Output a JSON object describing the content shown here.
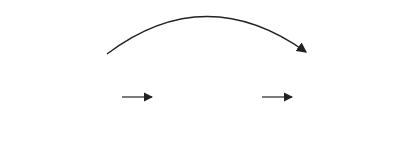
{
  "composition_label": "H ∘ D",
  "arrows": [
    {
      "label": "D"
    },
    {
      "label": "H"
    }
  ],
  "corner_labels": {
    "tl": "4",
    "tr": "1",
    "bl": "3",
    "br": "2"
  },
  "squares": [
    {
      "name": "original",
      "x": 28,
      "dots": [
        [
          35,
          45
        ],
        [
          47,
          45
        ],
        [
          35,
          57
        ],
        [
          47,
          57
        ],
        [
          97,
          45
        ],
        [
          35,
          97
        ],
        [
          97,
          97
        ],
        [
          35,
          109
        ],
        [
          47,
          109
        ],
        [
          87,
          109
        ]
      ]
    },
    {
      "name": "after-D",
      "x": 168,
      "dots": [
        [
          187,
          45
        ],
        [
          177,
          57
        ],
        [
          237,
          45
        ],
        [
          177,
          97
        ],
        [
          227,
          97
        ],
        [
          237,
          97
        ],
        [
          177,
          109
        ],
        [
          187,
          109
        ],
        [
          227,
          109
        ],
        [
          237,
          109
        ]
      ]
    },
    {
      "name": "after-H",
      "x": 308,
      "dots": [
        [
          317,
          45
        ],
        [
          327,
          45
        ],
        [
          367,
          45
        ],
        [
          377,
          45
        ],
        [
          317,
          57
        ],
        [
          367,
          57
        ],
        [
          377,
          57
        ],
        [
          317,
          97
        ],
        [
          327,
          109
        ],
        [
          377,
          109
        ]
      ]
    }
  ],
  "colors": {
    "stroke": "#333333",
    "dot": "#111111"
  }
}
